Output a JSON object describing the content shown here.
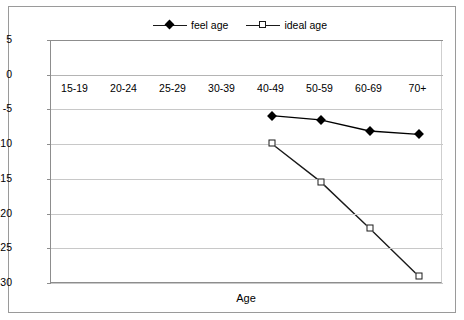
{
  "chart_data": {
    "type": "line",
    "title": "",
    "xlabel": "Age",
    "ylabel": "",
    "categories": [
      "15-19",
      "20-24",
      "25-29",
      "30-39",
      "40-49",
      "50-59",
      "60-69",
      "70+"
    ],
    "ylim": [
      -30,
      5
    ],
    "yticks": [
      5,
      0,
      -5,
      -10,
      -15,
      -20,
      -25,
      -30
    ],
    "ytick_labels": [
      "5",
      "0",
      "-5",
      "-10",
      "-15",
      "-20",
      "-25",
      "-30"
    ],
    "grid": true,
    "legend_position": "top-center",
    "series": [
      {
        "name": "feel age",
        "marker": "filled-diamond",
        "color": "#000000",
        "values": [
          null,
          null,
          null,
          null,
          -5.9,
          -6.5,
          -8.1,
          -8.6
        ]
      },
      {
        "name": "ideal age",
        "marker": "open-square",
        "color": "#1a1a1a",
        "values": [
          null,
          null,
          null,
          null,
          -9.9,
          -15.4,
          -22.1,
          -29.0
        ]
      }
    ]
  },
  "legend": {
    "entries": [
      {
        "label": "feel age"
      },
      {
        "label": "ideal age"
      }
    ]
  },
  "axis": {
    "x_title": "Age"
  },
  "colors": {
    "background": "#ffffff",
    "gridline": "#c8c8c8",
    "axis": "#8d8d8d",
    "frame": "#9a9a9a",
    "series": "#1a1a1a"
  }
}
